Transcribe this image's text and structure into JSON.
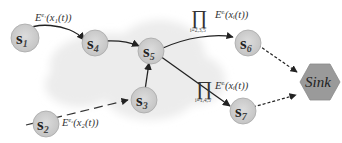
{
  "diagram": {
    "colors": {
      "node_fill": "#cfcfcf",
      "node_stroke": "#a8a8a8",
      "sink_fill": "#9a9a9a",
      "cloud_fill": "#ececec",
      "edge": "#222222"
    },
    "nodes": [
      {
        "id": "s1",
        "label": "s",
        "sub": "1"
      },
      {
        "id": "s2",
        "label": "s",
        "sub": "2"
      },
      {
        "id": "s3",
        "label": "s",
        "sub": "3"
      },
      {
        "id": "s4",
        "label": "s",
        "sub": "4"
      },
      {
        "id": "s5",
        "label": "s",
        "sub": "5"
      },
      {
        "id": "s6",
        "label": "s",
        "sub": "6"
      },
      {
        "id": "s7",
        "label": "s",
        "sub": "7"
      }
    ],
    "sink": {
      "label": "Sink"
    },
    "edges": [
      {
        "from": "s1",
        "to": "s4",
        "style": "solid",
        "label": "E^{e_1}(x_1(t))"
      },
      {
        "from": "s4",
        "to": "s5",
        "style": "solid"
      },
      {
        "from": "s2",
        "to": "s3",
        "style": "dashed",
        "label": "E^{e_2}(x_2(t))"
      },
      {
        "from": "s3",
        "to": "s5",
        "style": "solid"
      },
      {
        "from": "s5",
        "to": "s6",
        "style": "solid",
        "label": "∏ E^{e_i}(x_i(t)), i=2,3,5"
      },
      {
        "from": "s5",
        "to": "s7",
        "style": "solid",
        "label": "∏ E^{e_i}(x_i(t)), i=1,4,5"
      },
      {
        "from": "s6",
        "to": "Sink",
        "style": "dotted"
      },
      {
        "from": "s7",
        "to": "Sink",
        "style": "dotted"
      }
    ],
    "labels": {
      "e1_E": "E",
      "e1_sup": "e₁",
      "e1_arg": "(x₁(t))",
      "e2_E": "E",
      "e2_sup": "e₂",
      "e2_arg": "(x₂(t))",
      "prod_symbol": "∏",
      "prod_top_E": "E",
      "prod_top_sup": "eᵢ",
      "prod_top_arg": "(xᵢ(t))",
      "prod_top_index": "i=2,3,5",
      "prod_bot_E": "E",
      "prod_bot_sup": "eᵢ",
      "prod_bot_arg": "(xᵢ(t))",
      "prod_bot_index": "i=1,4,5"
    }
  }
}
